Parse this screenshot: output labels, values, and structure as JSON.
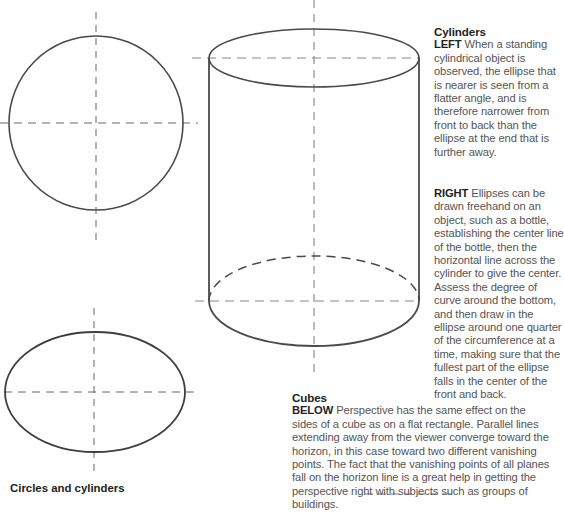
{
  "caption": "Circles and cylinders",
  "cylinders": {
    "heading": "Cylinders",
    "left": {
      "keyword": "LEFT",
      "text": "When a standing cylindrical object is observed, the ellipse that is nearer is seen from a flatter angle, and is therefore narrower from front to back than the ellipse at the end that is further away."
    },
    "right": {
      "keyword": "RIGHT",
      "text": "Ellipses can be drawn freehand on an object, such as a bottle, establishing the center line of the bottle, then the horizontal line across the cylinder to give the center. Assess the degree of curve around the bottom, and then draw in the ellipse around one quarter of the circumference at a time, making sure that the fullest part of the ellipse falls in the center of the front and back."
    }
  },
  "cubes": {
    "heading": "Cubes",
    "keyword": "BELOW",
    "text": "Perspective has the same effect on the sides of a cube as on a flat rectangle. Parallel lines extending away from the viewer converge toward the horizon, in this case toward two different vanishing points. The fact that the vanishing points of all planes fall on the horizon line is a great help in getting the perspective right with subjects such as groups of buildings."
  },
  "drawings": {
    "stroke_color": "#4a4a4a",
    "guide_color": "#6a6a6a"
  }
}
